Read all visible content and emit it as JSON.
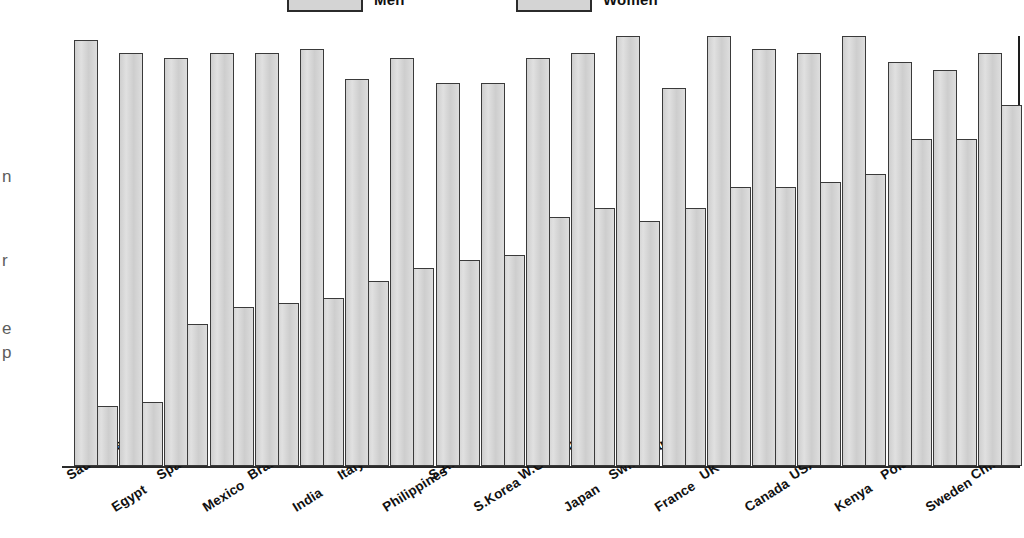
{
  "legend": {
    "items": [
      {
        "label": "Men",
        "key": "men",
        "color": "#d6d6d6"
      },
      {
        "label": "Women",
        "key": "women",
        "color": "#d6d6d6"
      }
    ]
  },
  "side_caption": {
    "fragments": [
      "n",
      "r",
      "e",
      "p"
    ]
  },
  "axis": {
    "baseline_color": "#2b2b2b",
    "right_rule_color": "#1d1d1d"
  },
  "chart_data": {
    "type": "bar",
    "title": "",
    "subtitle": "",
    "xlabel": "",
    "ylabel": "",
    "grid": false,
    "legend_position": "top",
    "ylim": [
      0,
      100
    ],
    "categories": [
      "Saudi Arabia",
      "Egypt",
      "Spain",
      "Mexico",
      "Brazil",
      "India",
      "Italy",
      "Philippines",
      "S.Africa",
      "S.Korea",
      "W.Germany",
      "Japan",
      "Switzerland",
      "France",
      "UK",
      "Canada",
      "USA",
      "Kenya",
      "Poland",
      "Sweden",
      "China"
    ],
    "series": [
      {
        "name": "Men",
        "values": [
          99,
          96,
          95,
          96,
          96,
          97,
          90,
          95,
          89,
          89,
          95,
          96,
          100,
          88,
          100,
          97,
          96,
          100,
          94,
          92,
          96
        ]
      },
      {
        "name": "Women",
        "values": [
          14,
          15,
          33,
          37,
          38,
          39,
          43,
          46,
          48,
          49,
          58,
          60,
          57,
          60,
          65,
          65,
          66,
          68,
          76,
          76,
          84
        ]
      }
    ]
  }
}
